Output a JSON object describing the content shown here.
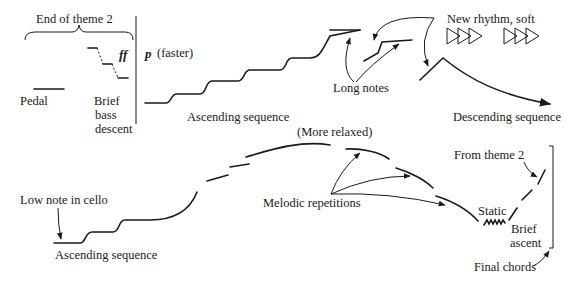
{
  "diagram": {
    "type": "musical-form-map",
    "colors": {
      "ink": "#1a1a1a",
      "background": "#ffffff"
    },
    "top_row": {
      "end_of_theme": "End of theme 2",
      "pedal": "Pedal",
      "bass_descent": [
        "Brief",
        "bass",
        "descent"
      ],
      "dynamic_ff": "ff",
      "dynamic_p": "p",
      "tempo": "(faster)",
      "ascending": "Ascending sequence",
      "long_notes": "Long notes",
      "new_rhythm": "New rhythm, soft",
      "rhythm_icon": "triangle-rhythm-icon",
      "descending": "Descending sequence"
    },
    "bottom_row": {
      "low_note": "Low note in cello",
      "ascending": "Ascending sequence",
      "relaxed": "(More relaxed)",
      "melodic": "Melodic repetitions",
      "from_theme": "From theme 2",
      "static": "Static",
      "brief_ascent": [
        "Brief",
        "ascent"
      ],
      "final_chords": "Final chords"
    }
  }
}
